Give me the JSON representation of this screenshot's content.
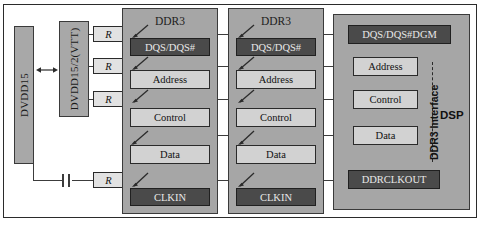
{
  "diagram": {
    "power": {
      "supply_label": "DVDD15",
      "termination_label": "DVDD15/2(VTT)"
    },
    "resistors": [
      {
        "label": "R",
        "signal": "DQS/DQS#"
      },
      {
        "label": "R",
        "signal": "Address"
      },
      {
        "label": "R",
        "signal": "Control"
      },
      {
        "label": "R",
        "signal": "CLK"
      }
    ],
    "memories": [
      {
        "title": "DDR3",
        "signals": [
          {
            "label": "DQS/DQS#",
            "style": "dark"
          },
          {
            "label": "Address",
            "style": "light"
          },
          {
            "label": "Control",
            "style": "light"
          },
          {
            "label": "Data",
            "style": "light"
          },
          {
            "label": "CLKIN",
            "style": "dark"
          }
        ]
      },
      {
        "title": "DDR3",
        "signals": [
          {
            "label": "DQS/DQS#",
            "style": "dark"
          },
          {
            "label": "Address",
            "style": "light"
          },
          {
            "label": "Control",
            "style": "light"
          },
          {
            "label": "Data",
            "style": "light"
          },
          {
            "label": "CLKIN",
            "style": "dark"
          }
        ]
      }
    ],
    "processor": {
      "title": "DSP",
      "interface_label": "DDR3 Interface",
      "signals": [
        {
          "label": "DQS/DQS#DGM",
          "style": "dark"
        },
        {
          "label": "Address",
          "style": "light"
        },
        {
          "label": "Control",
          "style": "light"
        },
        {
          "label": "Data",
          "style": "light"
        },
        {
          "label": "DDRCLKOUT",
          "style": "dark"
        }
      ]
    },
    "passives": {
      "capacitor_name": "decoupling-capacitor"
    },
    "colors": {
      "block_fill": "#a8a8a8",
      "signal_light": "#d2d2d2",
      "signal_dark": "#4a4a4a",
      "resistor_fill": "#e2e2e2",
      "wire": "#3c3c3c",
      "border": "#2a2a2a"
    }
  }
}
